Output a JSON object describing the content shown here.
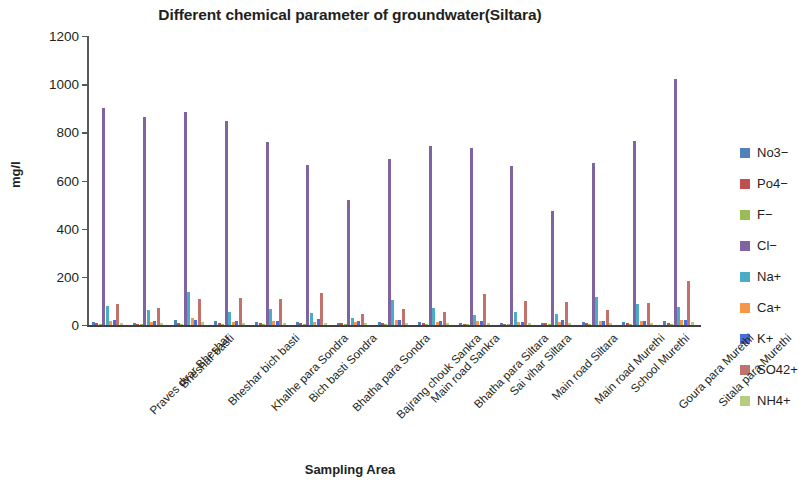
{
  "chart_data": {
    "type": "bar",
    "title": "Different chemical parameter of groundwater(Siltara)",
    "xlabel": "Sampling Area",
    "ylabel": "mg/l",
    "ylim": [
      0,
      1200
    ],
    "yticks": [
      0,
      200,
      400,
      600,
      800,
      1000,
      1200
    ],
    "grid": false,
    "legend_position": "right",
    "categories": [
      "Praves dvar Bheshar",
      "Bheshar basti",
      "Bheshar bich basti",
      "Khalhe para Sondra",
      "Bich basti Sondra",
      "Bhatha para Sondra",
      "Bajrang chouk Sankra",
      "Main road Sankra",
      "Bhatha para Siltara",
      "Sai vihar Siltara",
      "Main road Siltara",
      "Main road Murethi",
      "School Murethi",
      "Goura para Murethi",
      "Sitala para Murethi"
    ],
    "series": [
      {
        "name": "No3−",
        "color": "#4f81bd",
        "values": [
          14,
          10,
          22,
          18,
          12,
          14,
          10,
          12,
          14,
          10,
          8,
          10,
          12,
          14,
          16
        ]
      },
      {
        "name": "Po4−",
        "color": "#c0504d",
        "values": [
          8,
          6,
          10,
          8,
          8,
          8,
          10,
          8,
          8,
          6,
          6,
          8,
          8,
          8,
          10
        ]
      },
      {
        "name": "F−",
        "color": "#9bbb59",
        "values": [
          3,
          2,
          4,
          3,
          3,
          3,
          2,
          3,
          3,
          2,
          2,
          2,
          3,
          3,
          3
        ]
      },
      {
        "name": "Cl−",
        "color": "#8064a2",
        "values": [
          900,
          862,
          884,
          846,
          762,
          664,
          521,
          690,
          744,
          733,
          662,
          474,
          672,
          766,
          1020
        ]
      },
      {
        "name": "Na+",
        "color": "#4bacc6",
        "values": [
          78,
          62,
          136,
          54,
          66,
          48,
          30,
          104,
          70,
          42,
          52,
          44,
          118,
          88,
          76
        ]
      },
      {
        "name": "Ca+",
        "color": "#f79646",
        "values": [
          16,
          12,
          30,
          14,
          16,
          14,
          12,
          20,
          14,
          16,
          12,
          14,
          18,
          16,
          20
        ]
      },
      {
        "name": "K+",
        "color": "#4a6ddb",
        "values": [
          22,
          16,
          20,
          18,
          18,
          24,
          18,
          22,
          16,
          18,
          14,
          20,
          18,
          18,
          22
        ]
      },
      {
        "name": "SO42+",
        "color": "#c0726b",
        "values": [
          86,
          72,
          108,
          112,
          110,
          132,
          46,
          66,
          56,
          130,
          100,
          96,
          62,
          92,
          182
        ]
      },
      {
        "name": "NH4+",
        "color": "#b6cd7f",
        "values": [
          10,
          8,
          12,
          10,
          10,
          10,
          8,
          10,
          10,
          8,
          8,
          8,
          10,
          10,
          12
        ]
      }
    ]
  }
}
